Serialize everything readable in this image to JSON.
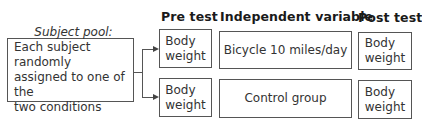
{
  "headers": {
    "pre_test": "Pre test",
    "independent_variable": "Independent variable",
    "post_test": "Post test"
  },
  "subject_pool": {
    "title": "Subject pool:",
    "lines": [
      "Each subject randomly",
      "assigned to one of the",
      "two conditions"
    ]
  },
  "rows": [
    {
      "pre_test": [
        "Body",
        "weight"
      ],
      "condition": "Bicycle 10 miles/day",
      "post_test": [
        "Body",
        "weight"
      ]
    },
    {
      "pre_test": [
        "Body",
        "weight"
      ],
      "condition": "Control group",
      "post_test": [
        "Body",
        "weight"
      ]
    }
  ],
  "colors": {
    "border": "#555555",
    "text": "#333333",
    "header": "#1a1a1a"
  }
}
